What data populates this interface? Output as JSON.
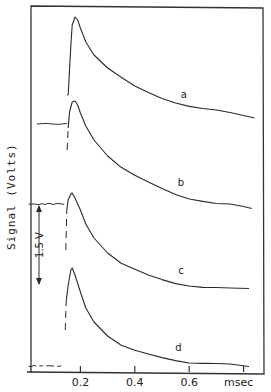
{
  "chart_data": {
    "type": "line",
    "title": "",
    "xlabel": "msec",
    "ylabel": "Signal (Volts)",
    "xlim": [
      0,
      0.87
    ],
    "x_ticks": [
      0.2,
      0.4,
      0.6,
      0.8
    ],
    "x_tick_labels": [
      "0.2",
      "0.4",
      "0.6",
      "msec"
    ],
    "grid": false,
    "legend": "inline labels",
    "scale_bar": {
      "label": "1.5 V",
      "value_volts": 1.5
    },
    "colors": {
      "ink": "#2a2a2a",
      "frame": "#333333",
      "background": "#ffffff"
    },
    "series": [
      {
        "name": "a",
        "label_pos_ms": 0.58,
        "baseline_px": null,
        "points_ms_px": [
          [
            0.155,
            95
          ],
          [
            0.16,
            70
          ],
          [
            0.165,
            45
          ],
          [
            0.17,
            25
          ],
          [
            0.18,
            17
          ],
          [
            0.19,
            20
          ],
          [
            0.2,
            28
          ],
          [
            0.22,
            42
          ],
          [
            0.25,
            55
          ],
          [
            0.3,
            68
          ],
          [
            0.35,
            78
          ],
          [
            0.4,
            87
          ],
          [
            0.45,
            93
          ],
          [
            0.5,
            98
          ],
          [
            0.55,
            102
          ],
          [
            0.6,
            106
          ],
          [
            0.65,
            109
          ],
          [
            0.7,
            111
          ],
          [
            0.75,
            113
          ],
          [
            0.8,
            115
          ],
          [
            0.84,
            117
          ]
        ]
      },
      {
        "name": "b",
        "label_pos_ms": 0.57,
        "baseline_range_ms": [
          0.04,
          0.15
        ],
        "baseline_px": 124,
        "points_ms_px": [
          [
            0.155,
            128
          ],
          [
            0.16,
            112
          ],
          [
            0.17,
            102
          ],
          [
            0.18,
            101
          ],
          [
            0.19,
            105
          ],
          [
            0.2,
            113
          ],
          [
            0.22,
            126
          ],
          [
            0.25,
            140
          ],
          [
            0.3,
            156
          ],
          [
            0.35,
            167
          ],
          [
            0.4,
            176
          ],
          [
            0.45,
            183
          ],
          [
            0.5,
            189
          ],
          [
            0.55,
            194
          ],
          [
            0.6,
            198
          ],
          [
            0.65,
            201
          ],
          [
            0.7,
            204
          ],
          [
            0.75,
            205
          ],
          [
            0.8,
            207
          ],
          [
            0.83,
            208
          ]
        ]
      },
      {
        "name": "c",
        "label_pos_ms": 0.57,
        "baseline_range_ms": [
          0.01,
          0.14
        ],
        "baseline_px": 204,
        "points_ms_px": [
          [
            0.15,
            210
          ],
          [
            0.155,
            200
          ],
          [
            0.165,
            194
          ],
          [
            0.17,
            193
          ],
          [
            0.18,
            198
          ],
          [
            0.2,
            210
          ],
          [
            0.22,
            224
          ],
          [
            0.25,
            238
          ],
          [
            0.3,
            253
          ],
          [
            0.35,
            263
          ],
          [
            0.4,
            270
          ],
          [
            0.45,
            276
          ],
          [
            0.5,
            280
          ],
          [
            0.55,
            283
          ],
          [
            0.6,
            285
          ],
          [
            0.65,
            287
          ],
          [
            0.7,
            288
          ],
          [
            0.75,
            289
          ],
          [
            0.82,
            289
          ]
        ]
      },
      {
        "name": "d",
        "label_pos_ms": 0.56,
        "baseline_range_ms": [
          0.01,
          0.14
        ],
        "baseline_px": 366,
        "points_ms_px": [
          [
            0.148,
            300
          ],
          [
            0.155,
            285
          ],
          [
            0.165,
            270
          ],
          [
            0.17,
            268
          ],
          [
            0.18,
            275
          ],
          [
            0.2,
            292
          ],
          [
            0.22,
            308
          ],
          [
            0.25,
            322
          ],
          [
            0.3,
            336
          ],
          [
            0.35,
            345
          ],
          [
            0.4,
            351
          ],
          [
            0.45,
            355
          ],
          [
            0.5,
            358
          ],
          [
            0.55,
            360
          ],
          [
            0.6,
            362
          ],
          [
            0.65,
            363
          ],
          [
            0.7,
            364
          ],
          [
            0.75,
            365
          ],
          [
            0.82,
            367
          ]
        ]
      }
    ]
  }
}
